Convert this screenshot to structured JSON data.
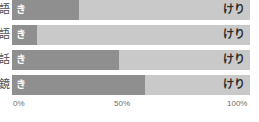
{
  "chart_data": {
    "type": "bar",
    "subtype": "stacked-horizontal-100-percent",
    "title": "",
    "xlabel": "",
    "ylabel": "",
    "orientation": "horizontal",
    "stacked": true,
    "normalized": true,
    "grid": false,
    "legend_position": "none",
    "xlim": [
      0,
      100
    ],
    "xticks": [
      0,
      50,
      100
    ],
    "xtick_labels": [
      "0%",
      "50%",
      "100%"
    ],
    "categories": [
      "語",
      "語",
      "話",
      "鏡"
    ],
    "series": [
      {
        "name": "き",
        "color": "#8f8f8f",
        "values": [
          28,
          10.5,
          45,
          56
        ]
      },
      {
        "name": "けり",
        "color": "#c9c9c9",
        "values": [
          72,
          89.5,
          55,
          44
        ]
      }
    ],
    "in_bar_labels": {
      "left": "き",
      "right": "けり"
    }
  },
  "rows": [
    {
      "label": "語",
      "left_pct": 28,
      "left_label": "き",
      "right_label": "けり"
    },
    {
      "label": "語",
      "left_pct": 10.5,
      "left_label": "き",
      "right_label": "けり"
    },
    {
      "label": "話",
      "left_pct": 45,
      "left_label": "き",
      "right_label": "けり"
    },
    {
      "label": "鏡",
      "left_pct": 56,
      "left_label": "き",
      "right_label": "けり"
    }
  ],
  "axis": {
    "start": "0%",
    "mid": "50%",
    "end": "100%"
  },
  "colors": {
    "left_segment": "#8f8f8f",
    "right_segment": "#c9c9c9",
    "background": "#ffffff",
    "axis_text": "#6e6e6e",
    "label_text": "#4b4b4b",
    "in_bar_left_text": "#ffffff",
    "in_bar_right_text": "#2b2b2b"
  }
}
